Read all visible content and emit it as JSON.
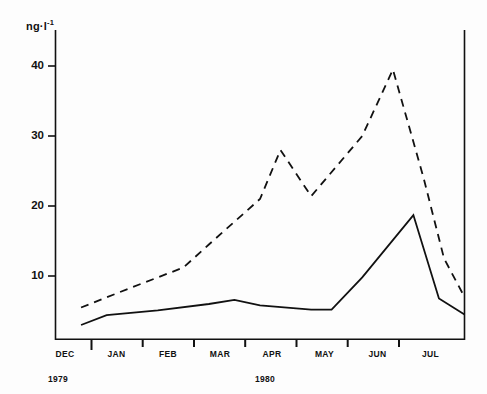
{
  "chart_data": {
    "type": "line",
    "title": "",
    "subtitle": "",
    "xlabel": "",
    "ylabel": "ng·l⁻¹",
    "ylabel_base": "ng·l",
    "ylabel_exponent": "-1",
    "ylim": [
      0,
      45
    ],
    "yticks": [
      10,
      20,
      30,
      40
    ],
    "ytick_labels": [
      "10",
      "20",
      "30",
      "40"
    ],
    "grid": false,
    "legend": "none",
    "categories": [
      "DEC",
      "JAN",
      "FEB",
      "MAR",
      "APR",
      "MAY",
      "JUN",
      "JUL"
    ],
    "xtick_labels": [
      "DEC",
      "JAN",
      "FEB",
      "MAR",
      "APR",
      "MAY",
      "JUN",
      "JUL"
    ],
    "year_labels": [
      {
        "text": "1979",
        "category": "DEC"
      },
      {
        "text": "1980",
        "category": "APR"
      }
    ],
    "x_axis_note": "Months DEC 1979 through JUL 1980; samples at mid-month and mid-interval positions",
    "series": [
      {
        "name": "upper-dashed-curve",
        "style": "dashed",
        "color": "#111111",
        "x": [
          0.5,
          1.0,
          1.5,
          2.0,
          2.5,
          3.0,
          3.5,
          4.0,
          4.5,
          5.0,
          5.5,
          6.0,
          6.5,
          7.0,
          7.5
        ],
        "values": [
          5.5,
          7.0,
          8.2,
          9.6,
          11.2,
          14.5,
          17.6,
          22.0,
          28.0,
          24.5,
          21.5,
          26.0,
          32.5,
          39.5,
          30.5
        ],
        "x_end": 8.0,
        "value_end": 7.0
      },
      {
        "name": "lower-solid-curve",
        "style": "solid",
        "color": "#111111",
        "x": [
          0.5,
          1.0,
          1.5,
          2.0,
          2.5,
          3.0,
          3.5,
          4.0,
          4.5,
          5.0,
          5.5,
          6.0,
          6.5,
          7.0,
          7.5
        ],
        "values": [
          3.0,
          4.0,
          4.6,
          5.0,
          5.4,
          6.0,
          6.6,
          6.1,
          5.7,
          5.3,
          5.2,
          9.8,
          14.2,
          18.7,
          12.0
        ],
        "x_end": 8.0,
        "value_end": 4.5
      }
    ],
    "series_points_solid": [
      {
        "x": 0.5,
        "y": 3.0
      },
      {
        "x": 1.0,
        "y": 4.4
      },
      {
        "x": 2.0,
        "y": 5.1
      },
      {
        "x": 3.0,
        "y": 6.0
      },
      {
        "x": 3.5,
        "y": 6.6
      },
      {
        "x": 4.0,
        "y": 5.8
      },
      {
        "x": 5.0,
        "y": 5.2
      },
      {
        "x": 5.4,
        "y": 5.2
      },
      {
        "x": 6.0,
        "y": 9.8
      },
      {
        "x": 7.0,
        "y": 18.7
      },
      {
        "x": 7.5,
        "y": 6.8
      },
      {
        "x": 8.0,
        "y": 4.5
      }
    ],
    "series_points_dashed": [
      {
        "x": 0.5,
        "y": 5.5
      },
      {
        "x": 1.5,
        "y": 8.4
      },
      {
        "x": 2.5,
        "y": 11.2
      },
      {
        "x": 3.0,
        "y": 14.5
      },
      {
        "x": 4.0,
        "y": 21.0
      },
      {
        "x": 4.4,
        "y": 28.0
      },
      {
        "x": 5.0,
        "y": 21.4
      },
      {
        "x": 6.0,
        "y": 30.0
      },
      {
        "x": 6.6,
        "y": 39.5
      },
      {
        "x": 7.2,
        "y": 24.0
      },
      {
        "x": 7.6,
        "y": 12.5
      },
      {
        "x": 8.0,
        "y": 7.0
      }
    ]
  },
  "figure": {
    "background_color": "#fdfdfd",
    "line_color": "#111111",
    "axis_color": "#111111"
  }
}
